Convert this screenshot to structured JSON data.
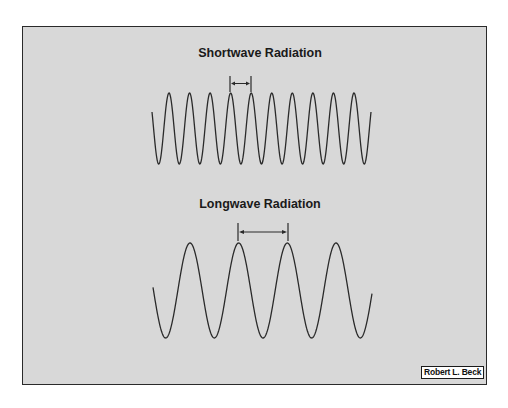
{
  "figure": {
    "credit": "Robert L. Beck",
    "colors": {
      "background": "#d8d8d8",
      "line": "#2a2a2a",
      "border": "#2a2a2a"
    }
  },
  "waves": [
    {
      "id": "shortwave",
      "title": "Shortwave Radiation",
      "cycles_shown": 10,
      "relative_wavelength": 1,
      "marker": "wavelength between adjacent crests"
    },
    {
      "id": "longwave",
      "title": "Longwave Radiation",
      "cycles_shown": 4,
      "relative_wavelength": 2.36,
      "marker": "wavelength between adjacent crests"
    }
  ]
}
